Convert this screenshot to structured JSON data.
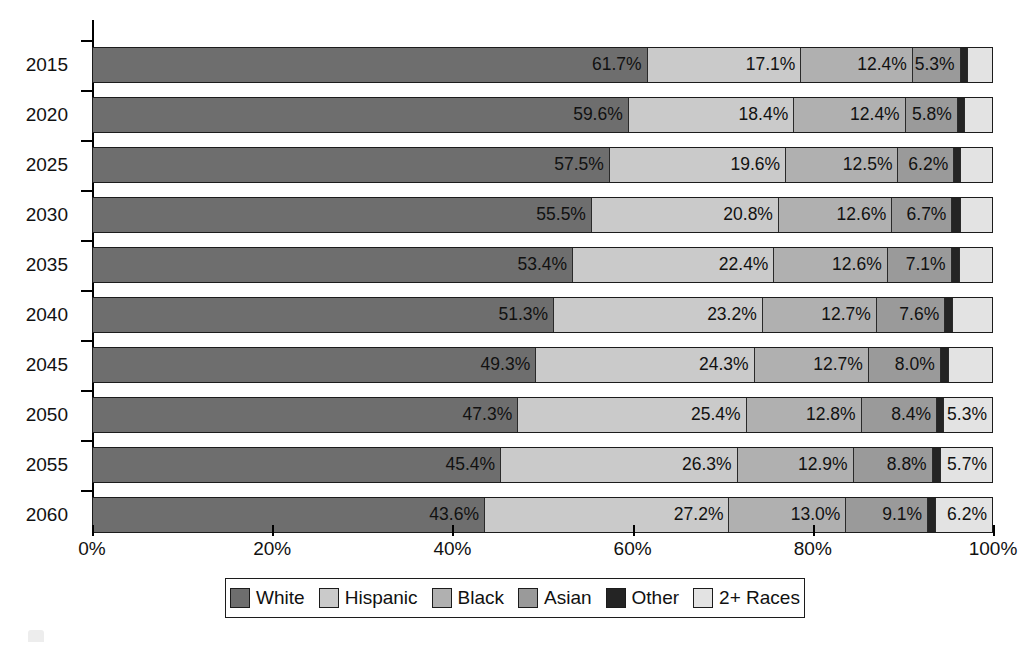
{
  "chart_data": {
    "type": "bar",
    "subtype": "horizontal-stacked-100",
    "title": "",
    "subtitle": "",
    "xlabel": "",
    "ylabel": "",
    "xlim": [
      0,
      100
    ],
    "grid": false,
    "legend_position": "bottom",
    "categories": [
      "2015",
      "2020",
      "2025",
      "2030",
      "2035",
      "2040",
      "2045",
      "2050",
      "2055",
      "2060"
    ],
    "x_tick_labels": [
      "0%",
      "20%",
      "40%",
      "60%",
      "80%",
      "100%"
    ],
    "x_tick_values": [
      0,
      20,
      40,
      60,
      80,
      100
    ],
    "series": [
      {
        "name": "White",
        "color": "#6e6e6e",
        "values": [
          61.7,
          59.6,
          57.5,
          55.5,
          53.4,
          51.3,
          49.3,
          47.3,
          45.4,
          43.6
        ],
        "labels": [
          "61.7%",
          "59.6%",
          "57.5%",
          "55.5%",
          "53.4%",
          "51.3%",
          "49.3%",
          "47.3%",
          "45.4%",
          "43.6%"
        ]
      },
      {
        "name": "Hispanic",
        "color": "#cacaca",
        "values": [
          17.1,
          18.4,
          19.6,
          20.8,
          22.4,
          23.2,
          24.3,
          25.4,
          26.3,
          27.2
        ],
        "labels": [
          "17.1%",
          "18.4%",
          "19.6%",
          "20.8%",
          "22.4%",
          "23.2%",
          "24.3%",
          "25.4%",
          "26.3%",
          "27.2%"
        ]
      },
      {
        "name": "Black",
        "color": "#b0b0b0",
        "values": [
          12.4,
          12.4,
          12.5,
          12.6,
          12.6,
          12.7,
          12.7,
          12.8,
          12.9,
          13.0
        ],
        "labels": [
          "12.4%",
          "12.4%",
          "12.5%",
          "12.6%",
          "12.6%",
          "12.7%",
          "12.7%",
          "12.8%",
          "12.9%",
          "13.0%"
        ]
      },
      {
        "name": "Asian",
        "color": "#9a9a9a",
        "values": [
          5.3,
          5.8,
          6.2,
          6.7,
          7.1,
          7.6,
          8.0,
          8.4,
          8.8,
          9.1
        ],
        "labels": [
          "5.3%",
          "5.8%",
          "6.2%",
          "6.7%",
          "7.1%",
          "7.6%",
          "8.0%",
          "8.4%",
          "8.8%",
          "9.1%"
        ]
      },
      {
        "name": "Other",
        "color": "#242424",
        "values": [
          0.8,
          0.8,
          0.8,
          0.9,
          0.9,
          0.9,
          0.9,
          0.8,
          0.9,
          0.9
        ],
        "labels": [
          "",
          "",
          "",
          "",
          "",
          "",
          "",
          "",
          "",
          ""
        ]
      },
      {
        "name": "2+ Races",
        "color": "#e3e3e3",
        "values": [
          2.7,
          3.0,
          3.4,
          3.5,
          3.6,
          4.3,
          4.8,
          5.3,
          5.7,
          6.2
        ],
        "labels": [
          "",
          "",
          "",
          "",
          "",
          "",
          "",
          "5.3%",
          "5.7%",
          "6.2%"
        ]
      }
    ]
  },
  "legend": {
    "items": [
      {
        "label": "White",
        "swatch_class": "sw-white"
      },
      {
        "label": "Hispanic",
        "swatch_class": "sw-hisp"
      },
      {
        "label": "Black",
        "swatch_class": "sw-black"
      },
      {
        "label": "Asian",
        "swatch_class": "sw-asian"
      },
      {
        "label": "Other",
        "swatch_class": "sw-other"
      },
      {
        "label": "2+ Races",
        "swatch_class": "sw-two"
      }
    ]
  }
}
